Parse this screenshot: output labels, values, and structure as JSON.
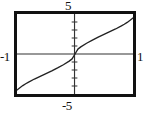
{
  "chart_data": {
    "type": "line",
    "title": "",
    "xlabel": "",
    "ylabel": "",
    "xlim": [
      -1,
      1
    ],
    "ylim": [
      -5,
      5
    ],
    "grid": false,
    "legend_position": "none",
    "x_tick_labels": [
      "-1",
      "1"
    ],
    "y_tick_labels": [
      "-5",
      "5"
    ],
    "y_tick_count": 10,
    "x_tick_count": 0,
    "series": [
      {
        "name": "odd-root curve",
        "color": "#222222",
        "x": [
          -1.0,
          -0.95,
          -0.9,
          -0.85,
          -0.8,
          -0.7,
          -0.6,
          -0.5,
          -0.4,
          -0.3,
          -0.2,
          -0.1,
          -0.05,
          0.0,
          0.05,
          0.1,
          0.2,
          0.3,
          0.4,
          0.5,
          0.6,
          0.7,
          0.8,
          0.85,
          0.9,
          0.95,
          1.0
        ],
        "y": [
          -4.5,
          -4.21,
          -3.95,
          -3.72,
          -3.51,
          -3.13,
          -2.79,
          -2.45,
          -2.11,
          -1.74,
          -1.34,
          -0.89,
          -0.61,
          0.0,
          0.61,
          0.89,
          1.34,
          1.74,
          2.11,
          2.45,
          2.79,
          3.13,
          3.51,
          3.72,
          3.95,
          4.21,
          4.5
        ]
      }
    ]
  },
  "labels": {
    "y_max": "5",
    "y_min": "-5",
    "x_min": "-1",
    "x_max": "1"
  },
  "colors": {
    "frame": "#111111",
    "axis": "#333333",
    "curve": "#222222",
    "background": "#ffffff"
  }
}
